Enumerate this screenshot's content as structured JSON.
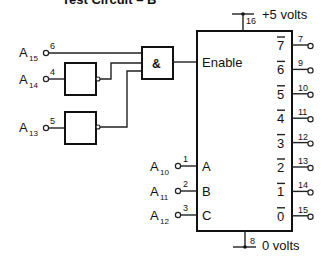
{
  "title": "Test Circuit – B",
  "power": {
    "vcc_label": "+5 volts",
    "vcc_pin": "16",
    "gnd_label": "0 volts",
    "gnd_pin": "8"
  },
  "gate_and": {
    "symbol": "&"
  },
  "decoder": {
    "enable_label": "Enable",
    "select_inputs": [
      {
        "signal": "A",
        "sub": "10",
        "pin": "1",
        "label": "A"
      },
      {
        "signal": "A",
        "sub": "11",
        "pin": "2",
        "label": "B"
      },
      {
        "signal": "A",
        "sub": "12",
        "pin": "3",
        "label": "C"
      }
    ],
    "outputs": [
      {
        "label": "7",
        "pin": "7"
      },
      {
        "label": "6",
        "pin": "9"
      },
      {
        "label": "5",
        "pin": "10"
      },
      {
        "label": "4",
        "pin": "11"
      },
      {
        "label": "3",
        "pin": "12"
      },
      {
        "label": "2",
        "pin": "13"
      },
      {
        "label": "1",
        "pin": "14"
      },
      {
        "label": "0",
        "pin": "15"
      }
    ]
  },
  "enable_inputs": [
    {
      "signal": "A",
      "sub": "15",
      "pin": "6"
    },
    {
      "signal": "A",
      "sub": "14",
      "pin": "4"
    },
    {
      "signal": "A",
      "sub": "13",
      "pin": "5"
    }
  ]
}
